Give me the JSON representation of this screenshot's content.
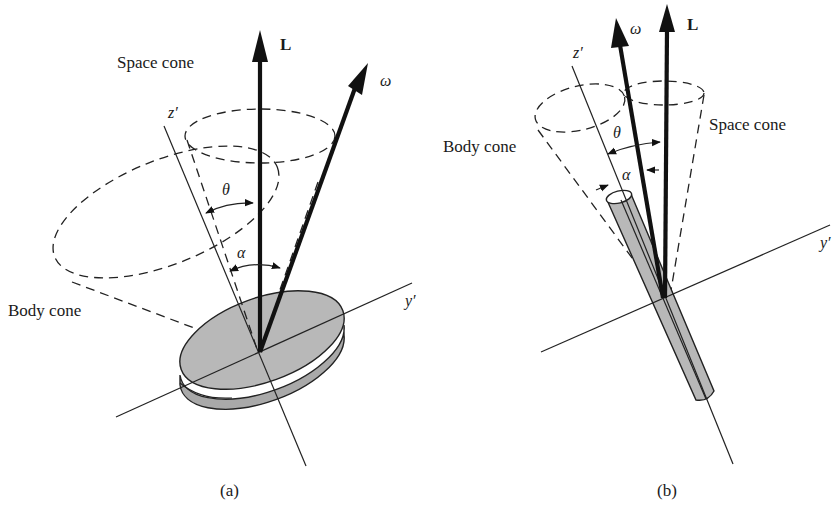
{
  "figure": {
    "panels": [
      {
        "id": "a",
        "caption": "(a)",
        "body_shape": "flat disk",
        "labels": {
          "space_cone": "Space cone",
          "body_cone": "Body cone",
          "L": "L",
          "omega": "ω",
          "z_prime": "z′",
          "y_prime": "y′",
          "theta": "θ",
          "alpha": "α"
        }
      },
      {
        "id": "b",
        "caption": "(b)",
        "body_shape": "long rod (cylinder)",
        "labels": {
          "space_cone": "Space cone",
          "body_cone": "Body cone",
          "L": "L",
          "omega": "ω",
          "z_prime": "z′",
          "y_prime": "y′",
          "theta": "θ",
          "alpha": "α"
        }
      }
    ],
    "colors": {
      "ink": "#1a1a1a",
      "body_fill": "#b8b8b8",
      "background": "#ffffff"
    }
  }
}
